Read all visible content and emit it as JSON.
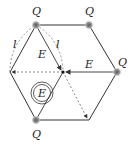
{
  "diagram": {
    "charge_label": "Q",
    "side_label": "l",
    "field_label": "E",
    "resultant_field_label": "E",
    "charges": [
      {
        "position": "top-left",
        "label": "Q"
      },
      {
        "position": "top-right",
        "label": "Q"
      },
      {
        "position": "right",
        "label": "Q"
      },
      {
        "position": "bottom-left",
        "label": "Q"
      }
    ],
    "colors": {
      "edge": "#333333",
      "dashed": "#555555",
      "charge": "#888888"
    }
  }
}
